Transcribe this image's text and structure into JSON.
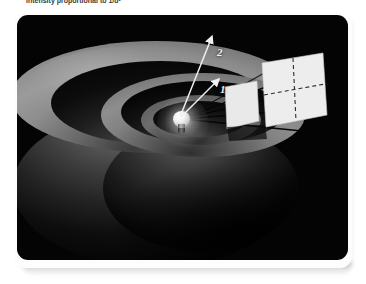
{
  "caption": {
    "text": "intensity proportional to 1/d²"
  },
  "figure": {
    "background_color": "#040404",
    "page_color": "#fdfdfd",
    "source": {
      "name": "light-bulb",
      "label": "point light source"
    },
    "distance_markers": [
      {
        "id": "1",
        "label": "1",
        "description": "unit distance from source"
      },
      {
        "id": "2",
        "label": "2",
        "description": "twice the unit distance"
      }
    ],
    "shells": [
      {
        "name": "inner-shell",
        "radius_units": 1
      },
      {
        "name": "middle-shell",
        "radius_units": 2
      },
      {
        "name": "outer-shell",
        "radius_units": 3
      }
    ],
    "panels": [
      {
        "name": "near-screen",
        "divisions": 1,
        "area_units": 1,
        "fill": "#e9e9e9"
      },
      {
        "name": "far-screen",
        "divisions": 4,
        "area_units": 4,
        "fill": "#ededed"
      }
    ],
    "colors": {
      "panel_fill": "#ececec",
      "ray_line": "#0a0a0a",
      "arrow_line": "#f0f0f0",
      "shell_highlight": "#9b9b9b",
      "shell_shadow": "#080808"
    }
  }
}
